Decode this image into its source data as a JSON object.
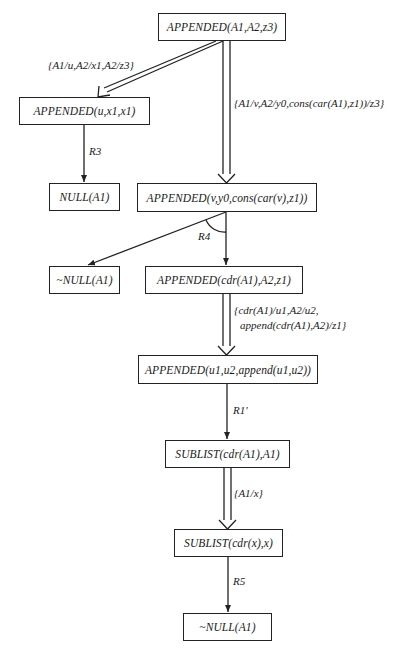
{
  "diagram": {
    "nodes": [
      {
        "id": "n1",
        "label": "APPENDED(A1,A2,z3)"
      },
      {
        "id": "n2",
        "label": "APPENDED(u,x1,x1)"
      },
      {
        "id": "n3",
        "label": "NULL(A1)"
      },
      {
        "id": "n4",
        "label": "APPENDED(v,y0,cons(car(v),z1))"
      },
      {
        "id": "n5",
        "label": "~NULL(A1)"
      },
      {
        "id": "n6",
        "label": "APPENDED(cdr(A1),A2,z1)"
      },
      {
        "id": "n7",
        "label": "APPENDED(u1,u2,append(u1,u2))"
      },
      {
        "id": "n8",
        "label": "SUBLIST(cdr(A1),A1)"
      },
      {
        "id": "n9",
        "label": "SUBLIST(cdr(x),x)"
      },
      {
        "id": "n10",
        "label": "~NULL(A1)"
      }
    ],
    "edges": [
      {
        "from": "n1",
        "to": "n2",
        "type": "double",
        "label": "{A1/u,A2/x1,A2/z3}"
      },
      {
        "from": "n1",
        "to": "n4",
        "type": "double",
        "label": "{A1/v,A2/y0,cons(car(A1),z1))/z3}"
      },
      {
        "from": "n2",
        "to": "n3",
        "type": "single",
        "label": "R3"
      },
      {
        "from": "n4",
        "to": "n5",
        "type": "single",
        "label": "R4"
      },
      {
        "from": "n4",
        "to": "n6",
        "type": "single",
        "label": ""
      },
      {
        "from": "n6",
        "to": "n7",
        "type": "double",
        "label_line1": "{cdr(A1)/u1,A2/u2,",
        "label_line2": "append(cdr(A1),A2)/z1}"
      },
      {
        "from": "n7",
        "to": "n8",
        "type": "single",
        "label": "R1'"
      },
      {
        "from": "n8",
        "to": "n9",
        "type": "double",
        "label": "{A1/x}"
      },
      {
        "from": "n9",
        "to": "n10",
        "type": "single",
        "label": "R5"
      }
    ]
  }
}
